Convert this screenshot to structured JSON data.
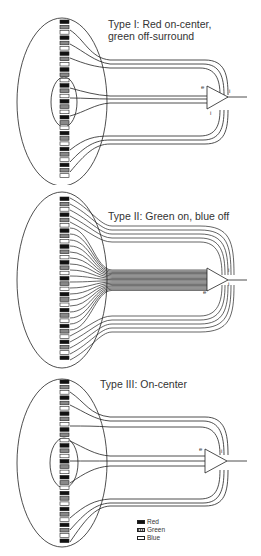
{
  "panels": [
    {
      "id": "type-1",
      "title_line1": "Type I: Red on-center,",
      "title_line2": "green off-surround",
      "labels": {
        "excitatory": "e",
        "inhibitory_top": "i",
        "inhibitory_bottom": "i"
      }
    },
    {
      "id": "type-2",
      "title_line1": "Type II: Green on, blue off",
      "labels": {
        "excitatory": "e",
        "inhibitory_top": "i",
        "inhibitory_bottom": "i"
      }
    },
    {
      "id": "type-3",
      "title_line1": "Type III: On-center",
      "labels": {
        "excitatory": "e",
        "inhibitory_top": "i"
      }
    }
  ],
  "legend": [
    {
      "label": "Red",
      "pattern": "solid-black"
    },
    {
      "label": "Green",
      "pattern": "hatched-gray"
    },
    {
      "label": "Blue",
      "pattern": "open-white"
    }
  ]
}
